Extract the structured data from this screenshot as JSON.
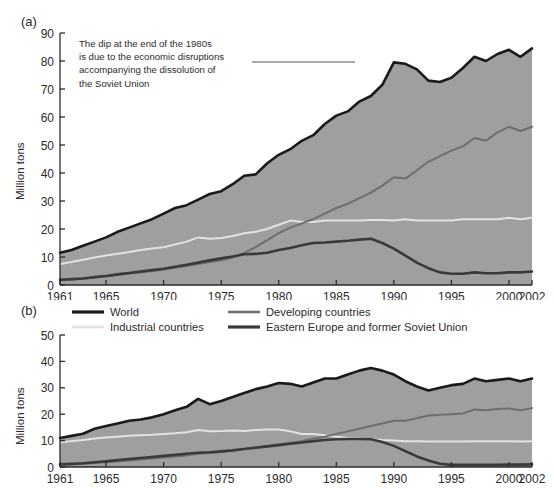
{
  "figure": {
    "panel_a_label": "(a)",
    "panel_b_label": "(b)",
    "ylabel": "Million tons"
  },
  "legend": {
    "position": "between-panels",
    "items": [
      {
        "label": "World",
        "color": "#1a1a1a",
        "width": 3.2
      },
      {
        "label": "Developing countries",
        "color": "#6e6e6e",
        "width": 2.6
      },
      {
        "label": "Industrial countries",
        "color": "#e2e2e2",
        "width": 2.6
      },
      {
        "label": "Eastern Europe and former Soviet Union",
        "color": "#3a3a3a",
        "width": 3.2
      }
    ]
  },
  "annotation": {
    "lines": [
      "The dip at the end of the 1980s",
      "is due to the economic disruptions",
      "accompanying the dissolution of",
      "the Soviet Union"
    ],
    "leader_line": {
      "x1": 252,
      "y1": 62,
      "x2": 355,
      "y2": 62,
      "color": "#555555"
    }
  },
  "colors": {
    "area_fill": "#9f9f9f",
    "world": "#1a1a1a",
    "developing": "#6e6e6e",
    "industrial": "#e2e2e2",
    "eastern_europe": "#3a3a3a",
    "axis": "#2b2b2b",
    "background": "#ffffff"
  },
  "chart_data": [
    {
      "type": "area",
      "panel": "(a)",
      "title": "",
      "xlabel": "",
      "ylabel": "Million tons",
      "xlim": [
        1961,
        2002
      ],
      "ylim": [
        0,
        90
      ],
      "yticks": [
        0,
        10,
        20,
        30,
        40,
        50,
        60,
        70,
        80,
        90
      ],
      "xticks": [
        1961,
        1965,
        1970,
        1975,
        1980,
        1985,
        1990,
        1995,
        2000,
        2002
      ],
      "grid": false,
      "x": [
        1961,
        1962,
        1963,
        1964,
        1965,
        1966,
        1967,
        1968,
        1969,
        1970,
        1971,
        1972,
        1973,
        1974,
        1975,
        1976,
        1977,
        1978,
        1979,
        1980,
        1981,
        1982,
        1983,
        1984,
        1985,
        1986,
        1987,
        1988,
        1989,
        1990,
        1991,
        1992,
        1993,
        1994,
        1995,
        1996,
        1997,
        1998,
        1999,
        2000,
        2001,
        2002
      ],
      "series": [
        {
          "name": "World",
          "color": "#1a1a1a",
          "filled": true,
          "values": [
            11.5,
            12.5,
            14.0,
            15.5,
            17.0,
            19.0,
            20.5,
            22.0,
            23.5,
            25.5,
            27.5,
            28.5,
            30.5,
            32.5,
            33.5,
            36.0,
            39.0,
            39.5,
            43.5,
            46.5,
            48.5,
            51.5,
            53.5,
            57.5,
            60.5,
            62.0,
            65.5,
            67.5,
            71.5,
            79.5,
            79.0,
            77.0,
            73.0,
            72.5,
            74.0,
            77.5,
            81.5,
            80.0,
            82.5,
            84.0,
            81.5,
            84.5
          ]
        },
        {
          "name": "Developing countries",
          "color": "#6e6e6e",
          "filled": false,
          "values": [
            1.8,
            2.0,
            2.3,
            2.7,
            3.1,
            3.6,
            4.1,
            4.5,
            5.0,
            5.5,
            6.2,
            6.8,
            7.5,
            8.2,
            8.8,
            9.8,
            11.5,
            13.5,
            16.0,
            18.5,
            20.5,
            22.0,
            23.5,
            25.5,
            27.5,
            29.0,
            31.0,
            33.0,
            35.5,
            38.5,
            38.0,
            41.0,
            44.0,
            46.0,
            48.0,
            49.5,
            52.5,
            51.5,
            54.5,
            56.5,
            55.0,
            56.5
          ]
        },
        {
          "name": "Industrial countries",
          "color": "#e2e2e2",
          "filled": false,
          "values": [
            7.5,
            8.2,
            9.0,
            9.8,
            10.5,
            11.2,
            11.8,
            12.5,
            13.0,
            13.5,
            14.5,
            15.5,
            17.0,
            16.5,
            16.8,
            17.5,
            18.5,
            19.0,
            20.0,
            21.5,
            23.0,
            22.5,
            22.5,
            23.0,
            23.0,
            23.0,
            23.0,
            23.2,
            23.2,
            23.0,
            23.5,
            23.0,
            23.0,
            23.0,
            23.0,
            23.5,
            23.5,
            23.5,
            23.5,
            24.0,
            23.5,
            24.0
          ]
        },
        {
          "name": "Eastern Europe and former Soviet Union",
          "color": "#3a3a3a",
          "filled": false,
          "values": [
            1.9,
            2.1,
            2.3,
            2.8,
            3.2,
            3.8,
            4.3,
            4.8,
            5.3,
            5.8,
            6.5,
            7.2,
            8.0,
            8.8,
            9.5,
            10.2,
            11.0,
            11.1,
            11.5,
            12.5,
            13.2,
            14.2,
            15.0,
            15.2,
            15.5,
            15.8,
            16.2,
            16.5,
            15.0,
            13.0,
            10.5,
            8.0,
            6.0,
            4.5,
            4.0,
            4.0,
            4.5,
            4.2,
            4.2,
            4.5,
            4.5,
            4.8
          ]
        }
      ]
    },
    {
      "type": "area",
      "panel": "(b)",
      "title": "",
      "xlabel": "",
      "ylabel": "Million tons",
      "xlim": [
        1961,
        2002
      ],
      "ylim": [
        0,
        50
      ],
      "yticks": [
        0,
        10,
        20,
        30,
        40,
        50
      ],
      "xticks": [
        1961,
        1965,
        1970,
        1975,
        1980,
        1985,
        1990,
        1995,
        2000,
        2002
      ],
      "grid": false,
      "x": [
        1961,
        1962,
        1963,
        1964,
        1965,
        1966,
        1967,
        1968,
        1969,
        1970,
        1971,
        1972,
        1973,
        1974,
        1975,
        1976,
        1977,
        1978,
        1979,
        1980,
        1981,
        1982,
        1983,
        1984,
        1985,
        1986,
        1987,
        1988,
        1989,
        1990,
        1991,
        1992,
        1993,
        1994,
        1995,
        1996,
        1997,
        1998,
        1999,
        2000,
        2001,
        2002
      ],
      "series": [
        {
          "name": "World",
          "color": "#1a1a1a",
          "filled": true,
          "values": [
            11.0,
            11.8,
            12.6,
            14.5,
            15.5,
            16.5,
            17.5,
            18.0,
            18.8,
            20.0,
            21.5,
            22.8,
            25.8,
            23.8,
            25.0,
            26.5,
            28.0,
            29.5,
            30.5,
            31.8,
            31.5,
            30.5,
            32.0,
            33.5,
            33.5,
            35.0,
            36.5,
            37.5,
            36.5,
            35.0,
            32.5,
            30.5,
            29.0,
            30.0,
            31.0,
            31.5,
            33.5,
            32.5,
            33.0,
            33.5,
            32.5,
            33.5
          ]
        },
        {
          "name": "Developing countries",
          "color": "#6e6e6e",
          "filled": false,
          "values": [
            0.9,
            1.0,
            1.2,
            1.5,
            1.8,
            2.1,
            2.5,
            2.8,
            3.2,
            3.6,
            4.0,
            4.4,
            5.0,
            5.3,
            5.7,
            6.2,
            6.8,
            7.5,
            8.0,
            8.6,
            9.2,
            9.8,
            10.8,
            11.5,
            12.5,
            13.5,
            14.5,
            15.5,
            16.5,
            17.5,
            17.5,
            18.5,
            19.5,
            19.8,
            20.0,
            20.3,
            21.8,
            21.5,
            22.0,
            22.2,
            21.5,
            22.3
          ]
        },
        {
          "name": "Industrial countries",
          "color": "#e2e2e2",
          "filled": false,
          "values": [
            9.3,
            9.8,
            10.2,
            10.8,
            11.2,
            11.5,
            11.8,
            12.0,
            12.2,
            12.5,
            12.8,
            13.2,
            14.0,
            13.5,
            13.6,
            13.8,
            13.6,
            14.0,
            14.2,
            14.2,
            13.5,
            12.5,
            12.5,
            12.0,
            11.5,
            11.0,
            10.8,
            10.5,
            10.2,
            10.0,
            9.8,
            9.8,
            9.7,
            9.7,
            9.7,
            9.7,
            9.8,
            9.8,
            9.8,
            9.8,
            9.7,
            9.8
          ]
        },
        {
          "name": "Eastern Europe and former Soviet Union",
          "color": "#3a3a3a",
          "filled": false,
          "values": [
            1.0,
            1.2,
            1.4,
            1.8,
            2.2,
            2.6,
            3.0,
            3.4,
            3.8,
            4.2,
            4.6,
            5.0,
            5.4,
            5.6,
            5.9,
            6.3,
            6.8,
            7.3,
            7.8,
            8.3,
            8.8,
            9.3,
            9.8,
            10.2,
            10.5,
            10.6,
            10.6,
            10.5,
            9.5,
            8.0,
            6.0,
            4.0,
            2.5,
            1.2,
            0.8,
            0.8,
            0.8,
            0.8,
            0.8,
            0.9,
            0.9,
            1.0
          ]
        }
      ]
    }
  ]
}
